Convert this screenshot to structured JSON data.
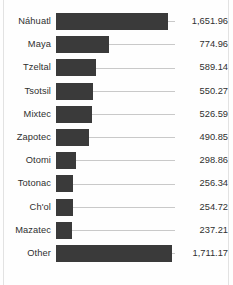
{
  "chart_data": {
    "type": "bar",
    "orientation": "horizontal",
    "title": "",
    "subtitle": "",
    "xlabel": "",
    "ylabel": "",
    "grid": false,
    "legend": null,
    "axis_visible": false,
    "value_labels_visible": true,
    "xlim": [
      0,
      1711.17
    ],
    "categories": [
      "Náhuatl",
      "Maya",
      "Tzeltal",
      "Tsotsil",
      "Mixtec",
      "Zapotec",
      "Otomi",
      "Totonac",
      "Ch'ol",
      "Mazatec",
      "Other"
    ],
    "values": [
      1651.96,
      774.96,
      589.14,
      550.27,
      526.59,
      490.85,
      298.86,
      256.34,
      254.72,
      237.21,
      1711.17
    ],
    "value_labels": [
      "1,651.96",
      "774.96",
      "589.14",
      "550.27",
      "526.59",
      "490.85",
      "298.86",
      "256.34",
      "254.72",
      "237.21",
      "1,711.17"
    ],
    "colors": {
      "bar": "#3a3a3a",
      "leader_line": "#c9c9c9",
      "text": "#2f2f2f",
      "background": "#fefefe"
    }
  }
}
